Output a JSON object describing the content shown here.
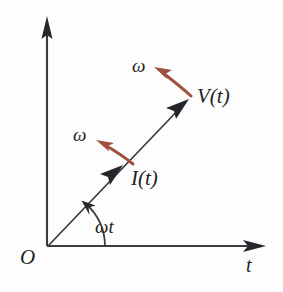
{
  "figure": {
    "type": "phasor-diagram",
    "background_color": "#fdfdfd",
    "axis_color": "#3a3a40",
    "vector_color": "#2b2b33",
    "omega_arrow_color": "#a0503c"
  },
  "axes": {
    "origin_label": "O",
    "horizontal_label": "t",
    "vertical_label": "",
    "origin_px": [
      48,
      246
    ],
    "x_axis_end_px": [
      265,
      246
    ],
    "y_axis_end_px": [
      47,
      18
    ]
  },
  "angle": {
    "label": "ωt",
    "value_deg": 46,
    "arc_start_deg": 0,
    "arc_end_deg": 46
  },
  "phasors": [
    {
      "name": "current",
      "label": "I(t)",
      "tip_px": [
        122,
        166
      ],
      "angle_deg": 46,
      "rotation_label": "ω"
    },
    {
      "name": "voltage",
      "label": "V(t)",
      "tip_px": [
        188,
        100
      ],
      "angle_deg": 46,
      "rotation_label": "ω"
    }
  ],
  "rotation_arrows": [
    {
      "name": "omega-voltage",
      "label": "ω",
      "color": "#a0503c",
      "from_px": [
        191,
        97
      ],
      "to_px": [
        157,
        70
      ]
    },
    {
      "name": "omega-current",
      "label": "ω",
      "color": "#a0503c",
      "from_px": [
        133,
        165
      ],
      "to_px": [
        99,
        142
      ]
    }
  ]
}
